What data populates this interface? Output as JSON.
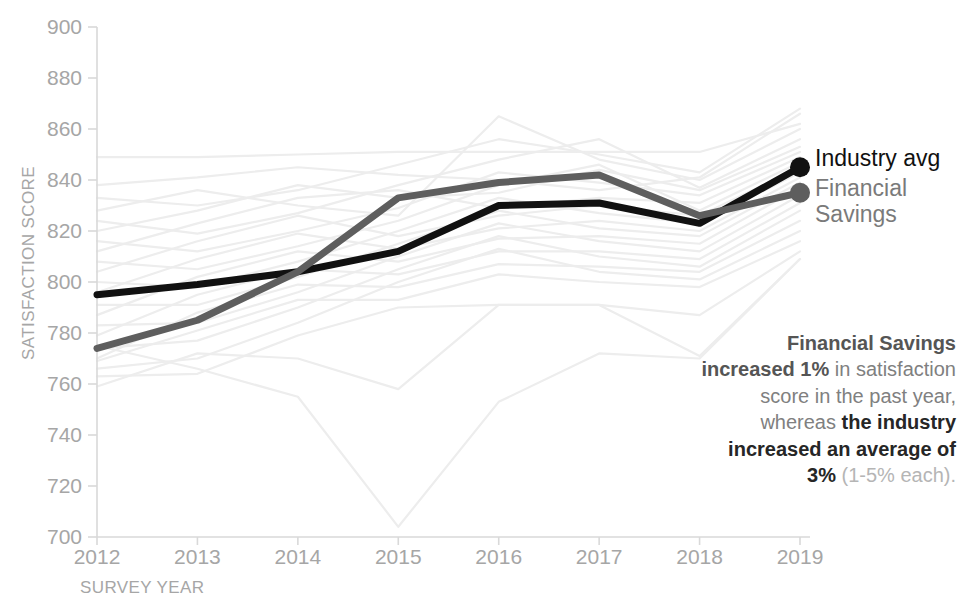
{
  "chart_data": {
    "type": "line",
    "title": "",
    "xlabel": "SURVEY YEAR",
    "ylabel": "SATISFACTION SCORE",
    "x": [
      2012,
      2013,
      2014,
      2015,
      2016,
      2017,
      2018,
      2019
    ],
    "xticklabels": [
      "2012",
      "2013",
      "2014",
      "2015",
      "2016",
      "2017",
      "2018",
      "2019"
    ],
    "yticklabels": [
      "900",
      "880",
      "860",
      "840",
      "820",
      "800",
      "780",
      "760",
      "740",
      "720",
      "700"
    ],
    "ylim": [
      700,
      900
    ],
    "ytick_step": 20,
    "grid": false,
    "legend_position": "right-end-of-line",
    "series": [
      {
        "name": "Industry avg",
        "highlight": true,
        "color": "#111111",
        "width": 7,
        "end_marker": true,
        "values": [
          795,
          799,
          804,
          812,
          830,
          831,
          823,
          845
        ]
      },
      {
        "name": "Financial Savings",
        "highlight": true,
        "color": "#5e5e5e",
        "width": 7,
        "end_marker": true,
        "values": [
          774,
          785,
          804,
          833,
          839,
          842,
          826,
          835
        ]
      },
      {
        "name": "bg-01",
        "highlight": false,
        "values": [
          849,
          849,
          850,
          851,
          851,
          851,
          851,
          862
        ]
      },
      {
        "name": "bg-02",
        "highlight": false,
        "values": [
          838,
          841,
          845,
          842,
          840,
          836,
          841,
          866
        ]
      },
      {
        "name": "bg-03",
        "highlight": false,
        "values": [
          833,
          830,
          836,
          846,
          856,
          850,
          843,
          868
        ]
      },
      {
        "name": "bg-04",
        "highlight": false,
        "values": [
          828,
          836,
          830,
          826,
          865,
          848,
          840,
          860
        ]
      },
      {
        "name": "bg-05",
        "highlight": false,
        "values": [
          824,
          819,
          827,
          838,
          848,
          856,
          837,
          856
        ]
      },
      {
        "name": "bg-06",
        "highlight": false,
        "values": [
          820,
          828,
          838,
          833,
          835,
          844,
          836,
          853
        ]
      },
      {
        "name": "bg-07",
        "highlight": false,
        "values": [
          816,
          812,
          820,
          829,
          843,
          839,
          834,
          851
        ]
      },
      {
        "name": "bg-08",
        "highlight": false,
        "values": [
          812,
          823,
          833,
          836,
          829,
          833,
          831,
          849
        ]
      },
      {
        "name": "bg-09",
        "highlight": false,
        "values": [
          808,
          805,
          814,
          824,
          838,
          846,
          828,
          847
        ]
      },
      {
        "name": "bg-10",
        "highlight": false,
        "values": [
          804,
          816,
          826,
          818,
          826,
          830,
          826,
          845
        ]
      },
      {
        "name": "bg-11",
        "highlight": false,
        "values": [
          800,
          798,
          808,
          820,
          833,
          827,
          823,
          843
        ]
      },
      {
        "name": "bg-12",
        "highlight": false,
        "values": [
          796,
          809,
          819,
          813,
          821,
          824,
          820,
          841
        ]
      },
      {
        "name": "bg-13",
        "highlight": false,
        "values": [
          791,
          791,
          802,
          815,
          828,
          821,
          818,
          839
        ]
      },
      {
        "name": "bg-14",
        "highlight": false,
        "values": [
          787,
          802,
          812,
          808,
          817,
          818,
          815,
          837
        ]
      },
      {
        "name": "bg-15",
        "highlight": false,
        "values": [
          783,
          784,
          796,
          810,
          823,
          816,
          812,
          834
        ]
      },
      {
        "name": "bg-16",
        "highlight": false,
        "values": [
          779,
          795,
          805,
          803,
          812,
          812,
          809,
          831
        ]
      },
      {
        "name": "bg-17",
        "highlight": false,
        "values": [
          774,
          777,
          790,
          805,
          818,
          810,
          806,
          828
        ]
      },
      {
        "name": "bg-18",
        "highlight": false,
        "values": [
          770,
          788,
          799,
          798,
          807,
          806,
          804,
          824
        ]
      },
      {
        "name": "bg-19",
        "highlight": false,
        "values": [
          766,
          770,
          784,
          800,
          813,
          804,
          801,
          820
        ]
      },
      {
        "name": "bg-20",
        "highlight": false,
        "values": [
          769,
          781,
          793,
          793,
          803,
          800,
          798,
          816
        ]
      },
      {
        "name": "bg-21",
        "highlight": false,
        "values": [
          763,
          764,
          779,
          790,
          791,
          791,
          787,
          812
        ]
      },
      {
        "name": "bg-22",
        "highlight": false,
        "values": [
          759,
          772,
          770,
          758,
          791,
          791,
          771,
          809
        ]
      },
      {
        "name": "bg-23",
        "highlight": false,
        "values": [
          775,
          766,
          755,
          704,
          753,
          772,
          770,
          809
        ]
      }
    ]
  },
  "legend": {
    "industry": "Industry avg",
    "financial_line1": "Financial",
    "financial_line2": "Savings"
  },
  "annotation": {
    "seg1": "Financial Savings increased 1%",
    "seg2": " in satisfaction score in the past year, whereas ",
    "seg3": "the industry increased an average of 3%",
    "seg4": " (1-5% each)."
  },
  "colors": {
    "industry": "#111111",
    "financial": "#5e5e5e",
    "background_lines": "#ededed",
    "axis": "#d9d9d9",
    "tick_text": "#a6a6a6",
    "annotation_text": "#808080",
    "annotation_bold_dark": "#262626",
    "annotation_light": "#b5b5b5"
  }
}
